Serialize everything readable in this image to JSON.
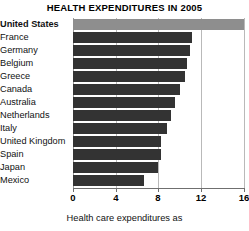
{
  "chart_data": {
    "type": "bar",
    "orientation": "horizontal",
    "title": "HEALTH EXPENDITURES IN 2005",
    "xlabel": "Health care expenditures as",
    "ylabel": "",
    "xlim": [
      0,
      16
    ],
    "grid": true,
    "legend": "none",
    "tick_labels": [
      "0",
      "4",
      "8",
      "12",
      "16"
    ],
    "ticks": [
      0,
      4,
      8,
      12,
      16
    ],
    "categories": [
      "United States",
      "France",
      "Germany",
      "Belgium",
      "Greece",
      "Canada",
      "Australia",
      "Netherlands",
      "Italy",
      "United Kingdom",
      "Spain",
      "Japan",
      "Mexico"
    ],
    "values": [
      16.0,
      11.2,
      11.0,
      10.7,
      10.5,
      10.0,
      9.6,
      9.2,
      8.8,
      8.3,
      8.3,
      8.0,
      6.7
    ],
    "highlight_index": 0,
    "colors": {
      "bar": "#333333",
      "bar_highlight": "#8e8e8e",
      "gridline": "#b9b9b9",
      "axis": "#6f6f6f",
      "text": "#111111",
      "background": "#ffffff"
    }
  }
}
